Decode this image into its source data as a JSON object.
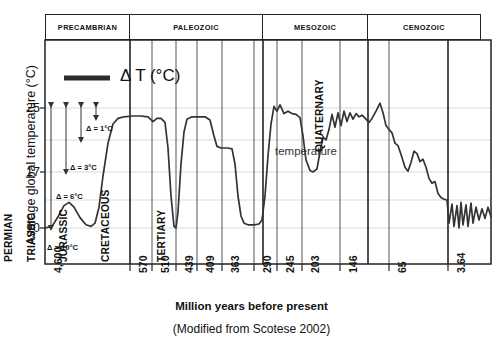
{
  "axes": {
    "ylabel": "Average global temperature (°C)",
    "yticks": [
      "25",
      "17",
      "10"
    ],
    "xlabel": "Million years before present",
    "xticks": [
      "4,600",
      "570",
      "510",
      "439",
      "409",
      "363",
      "290",
      "245",
      "203",
      "146",
      "65",
      "3.64"
    ]
  },
  "caption": "(Modified from Scotese 2002)",
  "legend": {
    "symbol_label": "Δ T (°C)"
  },
  "annotations": {
    "temperature_label": "temperature",
    "deltas": [
      {
        "label": "Δ = 1°C"
      },
      {
        "label": "Δ = 3°C"
      },
      {
        "label": "Δ = 6°C"
      },
      {
        "label": "Δ = 10°C"
      }
    ]
  },
  "eras": [
    {
      "name": "PRECAMBRIAN"
    },
    {
      "name": "PALEOZOIC"
    },
    {
      "name": "MESOZOIC"
    },
    {
      "name": "CENOZOIC"
    }
  ],
  "periods": [
    {
      "name": "CAMBRIAN"
    },
    {
      "name": "ORDOVICIAN [CO2]"
    },
    {
      "name": "SILURIAN"
    },
    {
      "name": "DEVONIAN"
    },
    {
      "name": "CARBONIFEROUS"
    },
    {
      "name": "PERMIAN"
    },
    {
      "name": "TRIASSIC"
    },
    {
      "name": "JURASSIC"
    },
    {
      "name": "CRETACEOUS"
    },
    {
      "name": "TERTIARY"
    },
    {
      "name": "QUATERNARY"
    }
  ],
  "colors": {
    "curve": "#333333",
    "frame": "#222222",
    "grid": "#d9d9d9",
    "legend_bar": "#2b2b2b",
    "text": "#111111"
  },
  "chart_data": {
    "type": "line",
    "title": "",
    "subtitle": "",
    "xlabel": "Million years before present",
    "ylabel": "Average global temperature (°C)",
    "xticks": [
      4600,
      570,
      510,
      439,
      409,
      363,
      290,
      245,
      203,
      146,
      65,
      3.64
    ],
    "xtick_px": [
      45,
      130,
      152,
      176,
      197,
      222,
      254,
      277,
      302,
      340,
      389,
      448
    ],
    "yticks": [
      25,
      17,
      10
    ],
    "ylim": [
      7.5,
      27.5
    ],
    "grid": true,
    "legend_position": "inside-top-left",
    "axis_note": "x axis is non-linear geological time, plotted by tick position",
    "series": [
      {
        "name": "temperature",
        "units": "°C",
        "points_px_y_vs_x": "values given as [x_px, temperature_C] pairs along the drawn curve",
        "values": [
          [
            45,
            10.0
          ],
          [
            52,
            10.2
          ],
          [
            58,
            11.4
          ],
          [
            64,
            12.8
          ],
          [
            69,
            13.2
          ],
          [
            74,
            12.6
          ],
          [
            80,
            11.3
          ],
          [
            86,
            10.4
          ],
          [
            91,
            10.2
          ],
          [
            95,
            10.6
          ],
          [
            99,
            12.6
          ],
          [
            103,
            16.5
          ],
          [
            108,
            20.6
          ],
          [
            113,
            23.0
          ],
          [
            118,
            23.7
          ],
          [
            124,
            23.9
          ],
          [
            132,
            24.0
          ],
          [
            141,
            24.0
          ],
          [
            148,
            23.9
          ],
          [
            153,
            23.3
          ],
          [
            157,
            23.7
          ],
          [
            161,
            23.7
          ],
          [
            165,
            23.2
          ],
          [
            168,
            20.0
          ],
          [
            171,
            14.0
          ],
          [
            174,
            10.2
          ],
          [
            176,
            10.0
          ],
          [
            178,
            12.0
          ],
          [
            181,
            18.0
          ],
          [
            184,
            22.0
          ],
          [
            187,
            23.6
          ],
          [
            192,
            23.9
          ],
          [
            199,
            23.9
          ],
          [
            205,
            23.9
          ],
          [
            210,
            23.5
          ],
          [
            214,
            21.5
          ],
          [
            217,
            20.2
          ],
          [
            221,
            20.0
          ],
          [
            228,
            20.0
          ],
          [
            232,
            19.9
          ],
          [
            235,
            18.0
          ],
          [
            238,
            14.0
          ],
          [
            241,
            11.5
          ],
          [
            244,
            10.6
          ],
          [
            248,
            10.4
          ],
          [
            254,
            10.4
          ],
          [
            259,
            10.5
          ],
          [
            262,
            11.0
          ],
          [
            265,
            14.0
          ],
          [
            268,
            19.0
          ],
          [
            271,
            23.0
          ],
          [
            274,
            25.2
          ],
          [
            277,
            24.6
          ],
          [
            280,
            25.4
          ],
          [
            284,
            24.3
          ],
          [
            288,
            24.6
          ],
          [
            292,
            24.3
          ],
          [
            296,
            24.2
          ],
          [
            300,
            23.8
          ],
          [
            303,
            21.5
          ],
          [
            306,
            18.5
          ],
          [
            310,
            17.2
          ],
          [
            313,
            17.0
          ],
          [
            317,
            17.4
          ],
          [
            320,
            19.5
          ],
          [
            323,
            21.4
          ],
          [
            326,
            21.0
          ],
          [
            329,
            22.3
          ],
          [
            332,
            24.2
          ],
          [
            335,
            22.6
          ],
          [
            338,
            24.4
          ],
          [
            341,
            22.8
          ],
          [
            344,
            24.6
          ],
          [
            347,
            23.3
          ],
          [
            350,
            24.4
          ],
          [
            353,
            23.6
          ],
          [
            356,
            24.3
          ],
          [
            359,
            23.9
          ],
          [
            362,
            24.1
          ],
          [
            366,
            23.6
          ],
          [
            369,
            23.2
          ],
          [
            372,
            23.7
          ],
          [
            376,
            24.6
          ],
          [
            380,
            25.6
          ],
          [
            383,
            24.4
          ],
          [
            386,
            22.8
          ],
          [
            389,
            22.3
          ],
          [
            392,
            21.9
          ],
          [
            395,
            20.6
          ],
          [
            398,
            20.3
          ],
          [
            402,
            18.8
          ],
          [
            405,
            17.6
          ],
          [
            408,
            17.1
          ],
          [
            411,
            18.2
          ],
          [
            414,
            19.6
          ],
          [
            417,
            19.3
          ],
          [
            420,
            18.3
          ],
          [
            423,
            18.6
          ],
          [
            426,
            17.6
          ],
          [
            429,
            16.2
          ],
          [
            432,
            15.6
          ],
          [
            435,
            15.8
          ],
          [
            438,
            14.3
          ],
          [
            441,
            13.8
          ],
          [
            444,
            13.6
          ],
          [
            447,
            13.5
          ],
          [
            449,
            10.6
          ],
          [
            452,
            13.0
          ],
          [
            454,
            10.2
          ],
          [
            457,
            12.8
          ],
          [
            459,
            10.0
          ],
          [
            461,
            13.2
          ],
          [
            463,
            10.4
          ],
          [
            466,
            12.9
          ],
          [
            468,
            10.2
          ],
          [
            471,
            13.1
          ],
          [
            473,
            10.6
          ],
          [
            476,
            12.6
          ],
          [
            479,
            11.0
          ],
          [
            482,
            12.4
          ],
          [
            485,
            11.2
          ],
          [
            488,
            12.6
          ],
          [
            491,
            11.4
          ]
        ]
      }
    ],
    "annotations": [
      {
        "text": "temperature",
        "x_px": 277,
        "y_C": 19.4
      },
      {
        "text": "Δ = 1°C",
        "type": "range-arrow",
        "top_C": 25.9,
        "bottom_C": 24.6
      },
      {
        "text": "Δ = 3°C",
        "type": "range-arrow",
        "top_C": 25.9,
        "bottom_C": 21.0
      },
      {
        "text": "Δ = 6°C",
        "type": "range-arrow",
        "top_C": 25.9,
        "bottom_C": 17.2
      },
      {
        "text": "Δ = 10°C",
        "type": "range-arrow",
        "top_C": 25.9,
        "bottom_C": 10.0
      }
    ],
    "era_bands": [
      {
        "name": "PRECAMBRIAN",
        "x0_px": 45,
        "x1_px": 130
      },
      {
        "name": "PALEOZOIC",
        "x0_px": 130,
        "x1_px": 263
      },
      {
        "name": "MESOZOIC",
        "x0_px": 263,
        "x1_px": 368
      },
      {
        "name": "CENOZOIC",
        "x0_px": 368,
        "x1_px": 481
      }
    ],
    "period_bands": [
      {
        "name": "CAMBRIAN",
        "x0_px": 130,
        "x1_px": 152
      },
      {
        "name": "ORDOVICIAN [CO2]",
        "x0_px": 152,
        "x1_px": 176
      },
      {
        "name": "SILURIAN",
        "x0_px": 176,
        "x1_px": 197
      },
      {
        "name": "DEVONIAN",
        "x0_px": 197,
        "x1_px": 222
      },
      {
        "name": "CARBONIFEROUS",
        "x0_px": 222,
        "x1_px": 254
      },
      {
        "name": "PERMIAN",
        "x0_px": 254,
        "x1_px": 277
      },
      {
        "name": "TRIASSIC",
        "x0_px": 277,
        "x1_px": 302
      },
      {
        "name": "JURASSIC",
        "x0_px": 302,
        "x1_px": 340
      },
      {
        "name": "CRETACEOUS",
        "x0_px": 340,
        "x1_px": 389
      },
      {
        "name": "TERTIARY",
        "x0_px": 389,
        "x1_px": 448
      },
      {
        "name": "QUATERNARY",
        "x0_px": 448,
        "x1_px": 491
      }
    ]
  }
}
